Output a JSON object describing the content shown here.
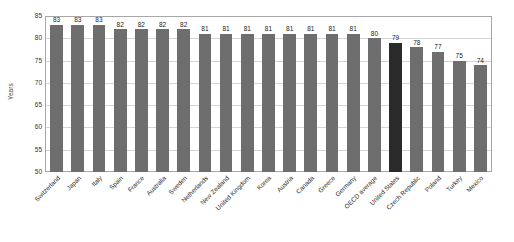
{
  "chart_data": {
    "type": "bar",
    "title": "",
    "subtitle": "",
    "xlabel": "",
    "ylabel": "Years",
    "ylim": [
      50,
      85
    ],
    "yticks": [
      50,
      55,
      60,
      65,
      70,
      75,
      80,
      85
    ],
    "grid": true,
    "legend": "none",
    "categories": [
      "Switzerland",
      "Japan",
      "Italy",
      "Spain",
      "France",
      "Australia",
      "Sweden",
      "Netherlands",
      "New Zealand",
      "United Kingdom",
      "Korea",
      "Austria",
      "Canada",
      "Greece",
      "Germany",
      "OECD average",
      "United States",
      "Czech Republic",
      "Poland",
      "Turkey",
      "Mexico"
    ],
    "values": [
      83,
      83,
      83,
      82,
      82,
      82,
      82,
      81,
      81,
      81,
      81,
      81,
      81,
      81,
      81,
      80,
      79,
      78,
      77,
      75,
      74
    ],
    "data_labels": [
      "83",
      "83",
      "83",
      "82",
      "82",
      "82",
      "82",
      "81",
      "81",
      "81",
      "81",
      "81",
      "81",
      "81",
      "81",
      "80",
      "79",
      "78",
      "77",
      "75",
      "74"
    ],
    "highlighted_category": "United States",
    "colors": {
      "bar": "#6e6e6e",
      "bar_highlight": "#2a2a2a",
      "gridline": "#d4d4d4",
      "frame": "#a8a8a8",
      "background": "#ffffff",
      "text": "#2b2b2b"
    }
  }
}
